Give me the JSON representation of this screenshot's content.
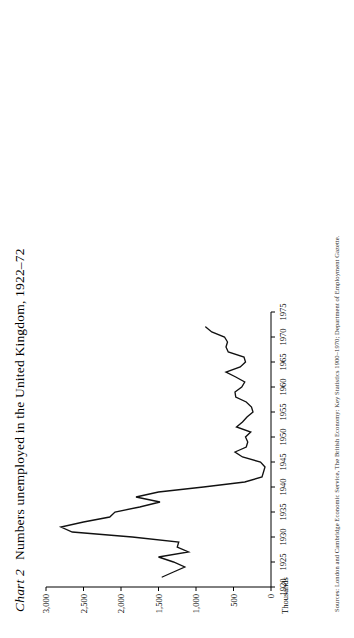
{
  "figure": {
    "label": "Chart 2",
    "title": "Numbers unemployed in the United Kingdom, 1922–72",
    "units_label": "Thousands",
    "source": "Sources: London and Cambridge Economic Service, The British Economy: Key Statistics 1900–1970; Department of Employment Gazette."
  },
  "chart_data": {
    "type": "line",
    "title": "Numbers unemployed in the United Kingdom, 1922–72",
    "xlabel": "",
    "ylabel": "Thousands",
    "xlim": [
      1920,
      1975
    ],
    "ylim": [
      0,
      3000
    ],
    "grid": false,
    "legend": null,
    "xticks": [
      1920,
      1925,
      1930,
      1935,
      1940,
      1945,
      1950,
      1955,
      1960,
      1965,
      1970,
      1975
    ],
    "xticklabels": [
      "1920",
      "1925",
      "1930",
      "1935",
      "1940",
      "1945",
      "1950",
      "1955",
      "1960",
      "1965",
      "1970",
      "1975"
    ],
    "yticks": [
      0,
      500,
      1000,
      1500,
      2000,
      2500,
      3000
    ],
    "yticklabels": [
      "0",
      "500",
      "1,000",
      "1,500",
      "2,000",
      "2,500",
      "3,000"
    ],
    "x": [
      1922,
      1923,
      1924,
      1925,
      1926,
      1927,
      1928,
      1929,
      1930,
      1931,
      1932,
      1933,
      1934,
      1935,
      1936,
      1937,
      1938,
      1939,
      1940,
      1941,
      1942,
      1943,
      1944,
      1945,
      1946,
      1947,
      1948,
      1949,
      1950,
      1951,
      1952,
      1953,
      1954,
      1955,
      1956,
      1957,
      1958,
      1959,
      1960,
      1961,
      1962,
      1963,
      1964,
      1965,
      1966,
      1967,
      1968,
      1969,
      1970,
      1971,
      1972
    ],
    "y": [
      1450,
      1300,
      1150,
      1300,
      1500,
      1100,
      1250,
      1230,
      1850,
      2650,
      2800,
      2500,
      2150,
      2080,
      1750,
      1480,
      1800,
      1500,
      900,
      350,
      120,
      100,
      80,
      140,
      380,
      480,
      330,
      310,
      340,
      270,
      460,
      380,
      320,
      240,
      260,
      330,
      470,
      480,
      390,
      350,
      470,
      600,
      410,
      340,
      360,
      570,
      600,
      580,
      620,
      790,
      870
    ]
  }
}
